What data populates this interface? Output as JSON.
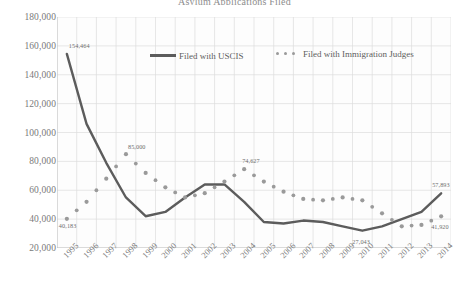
{
  "chart_data": {
    "type": "line",
    "title": "Asylum Applications Filed",
    "xlabel": "",
    "ylabel": "",
    "ylim": [
      0,
      180000
    ],
    "ytick_step": 20000,
    "grid": true,
    "legend_position": "top-center",
    "categories": [
      "1995",
      "1996",
      "1997",
      "1998",
      "1999",
      "2000",
      "2001",
      "2002",
      "2003",
      "2004",
      "2005",
      "2006",
      "2007",
      "2008",
      "2009",
      "2010",
      "2011",
      "2012",
      "2013",
      "2014"
    ],
    "series": [
      {
        "name": "Filed with USCIS",
        "style": "solid",
        "color": "#5c5c5c",
        "values": [
          154464,
          106000,
          79000,
          55000,
          42000,
          45000,
          55000,
          64000,
          64000,
          52000,
          38000,
          37000,
          39000,
          38000,
          35000,
          32000,
          35000,
          40000,
          45000,
          57893
        ]
      },
      {
        "name": "Filed with Immigration Judges",
        "style": "dotted",
        "color": "#9a9a9a",
        "values": [
          40183,
          52000,
          68000,
          85000,
          72000,
          62000,
          55000,
          58000,
          66000,
          74627,
          66000,
          59000,
          54000,
          53000,
          55000,
          53000,
          44000,
          35000,
          36000,
          41920
        ]
      }
    ],
    "point_labels": [
      {
        "series": "Filed with USCIS",
        "category": "1995",
        "text": "154,464"
      },
      {
        "series": "Filed with Immigration Judges",
        "category": "1995",
        "text": "40,183"
      },
      {
        "series": "Filed with Immigration Judges",
        "category": "1998",
        "text": "85,000"
      },
      {
        "series": "Filed with Immigration Judges",
        "category": "2004",
        "text": "74,627"
      },
      {
        "series": "Filed with USCIS",
        "category": "2010",
        "text": "27,043"
      },
      {
        "series": "Filed with USCIS",
        "category": "2014",
        "text": "57,893"
      },
      {
        "series": "Filed with Immigration Judges",
        "category": "2014",
        "text": "41,920"
      }
    ],
    "ytick_labels": [
      "180,000",
      "160,000",
      "140,000",
      "120,000",
      "100,000",
      "80,000",
      "60,000",
      "40,000",
      "20,000"
    ]
  }
}
